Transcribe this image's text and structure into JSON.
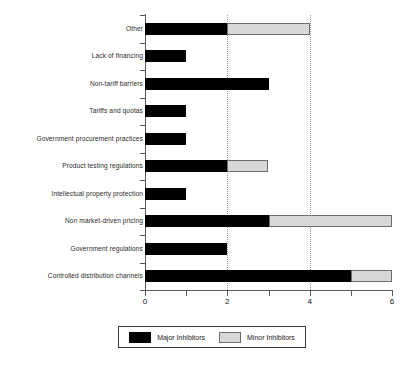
{
  "chart_data": {
    "type": "bar",
    "orientation": "horizontal",
    "stacked": true,
    "title": "",
    "xlabel": "",
    "ylabel": "",
    "xlim": [
      0,
      6
    ],
    "xticks": [
      0,
      2,
      4,
      6
    ],
    "xtick_labels": [
      "0",
      "2",
      "4",
      "6"
    ],
    "minor_xticks": [
      1,
      3,
      5
    ],
    "gridlines": [
      2,
      4
    ],
    "grid": true,
    "legend_position": "bottom",
    "categories": [
      "Other",
      "Lack of financing",
      "Non-tariff barriers",
      "Tariffs and quotas",
      "Government procurement practices",
      "Product testing regulations",
      "Intellectual property protection",
      "Non market-driven pricing",
      "Government regulations",
      "Controlled distribution channels"
    ],
    "series": [
      {
        "name": "Major Inhibitors",
        "color": "#000000",
        "values": [
          2,
          1,
          3,
          1,
          1,
          2,
          1,
          3,
          2,
          5
        ]
      },
      {
        "name": "Minor Inhibitors",
        "color": "#d8d8d8",
        "values": [
          2,
          0,
          0,
          0,
          0,
          1,
          0,
          3,
          0,
          1
        ]
      }
    ],
    "totals": [
      4,
      1,
      3,
      1,
      1,
      3,
      1,
      6,
      2,
      6
    ]
  },
  "legend": {
    "entries": [
      {
        "label": "Major Inhibitors",
        "swatch": "major"
      },
      {
        "label": "Minor Inhibitors",
        "swatch": "minor"
      }
    ]
  },
  "caption": {
    "text": ""
  }
}
